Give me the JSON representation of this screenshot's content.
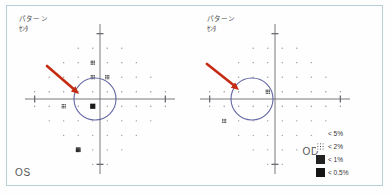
{
  "report": {
    "frame_border_color": "#b9cdd6",
    "background_color": "#fefefe"
  },
  "panels": [
    {
      "id": "os",
      "eye_label": "OS",
      "header_line1": "パターン",
      "header_line2": "ｾﾝﾀ",
      "annotation": {
        "arrow_color": "#c52a12",
        "circle_color": "#5a5f9e",
        "arrow_from": [
          40,
          60
        ],
        "arrow_to": [
          72,
          88
        ],
        "circle_center": [
          88,
          93
        ],
        "circle_radius": 21
      }
    },
    {
      "id": "od",
      "eye_label": "OD",
      "header_line1": "パターン",
      "header_line2": "ｾﾝﾀ",
      "annotation": {
        "arrow_color": "#c52a12",
        "circle_color": "#5a5f9e",
        "arrow_from": [
          12,
          58
        ],
        "arrow_to": [
          44,
          84
        ],
        "circle_center": [
          57,
          93
        ],
        "circle_radius": 21
      }
    }
  ],
  "legend": {
    "title": "probability-symbols",
    "rows": [
      {
        "symbol": "stipple-sparse",
        "label": "< 5%"
      },
      {
        "symbol": "stipple-medium",
        "label": "< 2%"
      },
      {
        "symbol": "stipple-dense",
        "label": "< 1%"
      },
      {
        "symbol": "solid-black",
        "label": "< 0.5%"
      }
    ]
  },
  "chart_data": {
    "type": "scatter",
    "xlabel": "",
    "ylabel": "",
    "xlim": [
      -30,
      30
    ],
    "ylim": [
      -30,
      30
    ],
    "grid": false,
    "note": "Humphrey 24-2 test-point grid. severity 0 = normal dot, 1 = <5%, 2 = <2%, 3 = <1%, 4 = <0.5%",
    "series": [
      {
        "name": "OS",
        "points": [
          {
            "x": -9,
            "y": 21,
            "severity": 0
          },
          {
            "x": -3,
            "y": 21,
            "severity": 0
          },
          {
            "x": 3,
            "y": 21,
            "severity": 0
          },
          {
            "x": 9,
            "y": 21,
            "severity": 0
          },
          {
            "x": -15,
            "y": 15,
            "severity": 0
          },
          {
            "x": -9,
            "y": 15,
            "severity": 0
          },
          {
            "x": -3,
            "y": 15,
            "severity": 2
          },
          {
            "x": 3,
            "y": 15,
            "severity": 0
          },
          {
            "x": 9,
            "y": 15,
            "severity": 0
          },
          {
            "x": 15,
            "y": 15,
            "severity": 0
          },
          {
            "x": -21,
            "y": 9,
            "severity": 0
          },
          {
            "x": -15,
            "y": 9,
            "severity": 0
          },
          {
            "x": -9,
            "y": 9,
            "severity": 0
          },
          {
            "x": -3,
            "y": 9,
            "severity": 2
          },
          {
            "x": 3,
            "y": 9,
            "severity": 2
          },
          {
            "x": 9,
            "y": 9,
            "severity": 0
          },
          {
            "x": 15,
            "y": 9,
            "severity": 0
          },
          {
            "x": 21,
            "y": 9,
            "severity": 0
          },
          {
            "x": -27,
            "y": 3,
            "severity": 0
          },
          {
            "x": -21,
            "y": 3,
            "severity": 0
          },
          {
            "x": -15,
            "y": 3,
            "severity": 0
          },
          {
            "x": -9,
            "y": 3,
            "severity": 0
          },
          {
            "x": -3,
            "y": 3,
            "severity": 0
          },
          {
            "x": 3,
            "y": 3,
            "severity": 0
          },
          {
            "x": 9,
            "y": 3,
            "severity": 0
          },
          {
            "x": 15,
            "y": 3,
            "severity": 0
          },
          {
            "x": 21,
            "y": 3,
            "severity": 0
          },
          {
            "x": 27,
            "y": 3,
            "severity": 0
          },
          {
            "x": -27,
            "y": -3,
            "severity": 0
          },
          {
            "x": -21,
            "y": -3,
            "severity": 0
          },
          {
            "x": -15,
            "y": -3,
            "severity": 2
          },
          {
            "x": -9,
            "y": -3,
            "severity": 0
          },
          {
            "x": -3,
            "y": -3,
            "severity": 4
          },
          {
            "x": 3,
            "y": -3,
            "severity": 0
          },
          {
            "x": 9,
            "y": -3,
            "severity": 0
          },
          {
            "x": 15,
            "y": -3,
            "severity": 0
          },
          {
            "x": 21,
            "y": -3,
            "severity": 0
          },
          {
            "x": 27,
            "y": -3,
            "severity": 0
          },
          {
            "x": -21,
            "y": -9,
            "severity": 0
          },
          {
            "x": -15,
            "y": -9,
            "severity": 0
          },
          {
            "x": -9,
            "y": -9,
            "severity": 0
          },
          {
            "x": -3,
            "y": -9,
            "severity": 0
          },
          {
            "x": 3,
            "y": -9,
            "severity": 0
          },
          {
            "x": 9,
            "y": -9,
            "severity": 0
          },
          {
            "x": 15,
            "y": -9,
            "severity": 0
          },
          {
            "x": 21,
            "y": -9,
            "severity": 0
          },
          {
            "x": -15,
            "y": -15,
            "severity": 0
          },
          {
            "x": -9,
            "y": -15,
            "severity": 0
          },
          {
            "x": -3,
            "y": -15,
            "severity": 0
          },
          {
            "x": 3,
            "y": -15,
            "severity": 0
          },
          {
            "x": 9,
            "y": -15,
            "severity": 0
          },
          {
            "x": 15,
            "y": -15,
            "severity": 0
          },
          {
            "x": -9,
            "y": -21,
            "severity": 3
          },
          {
            "x": -3,
            "y": -21,
            "severity": 0
          },
          {
            "x": 3,
            "y": -21,
            "severity": 0
          },
          {
            "x": 9,
            "y": -21,
            "severity": 0
          },
          {
            "x": -3,
            "y": -27,
            "severity": 0
          },
          {
            "x": 3,
            "y": -27,
            "severity": 0
          }
        ]
      },
      {
        "name": "OD",
        "points": [
          {
            "x": -9,
            "y": 21,
            "severity": 0
          },
          {
            "x": -3,
            "y": 21,
            "severity": 0
          },
          {
            "x": 3,
            "y": 21,
            "severity": 0
          },
          {
            "x": 9,
            "y": 21,
            "severity": 0
          },
          {
            "x": -15,
            "y": 15,
            "severity": 0
          },
          {
            "x": -9,
            "y": 15,
            "severity": 0
          },
          {
            "x": -3,
            "y": 15,
            "severity": 0
          },
          {
            "x": 3,
            "y": 15,
            "severity": 0
          },
          {
            "x": 9,
            "y": 15,
            "severity": 0
          },
          {
            "x": 15,
            "y": 15,
            "severity": 0
          },
          {
            "x": -21,
            "y": 9,
            "severity": 0
          },
          {
            "x": -15,
            "y": 9,
            "severity": 0
          },
          {
            "x": -9,
            "y": 9,
            "severity": 0
          },
          {
            "x": -3,
            "y": 9,
            "severity": 0
          },
          {
            "x": 3,
            "y": 9,
            "severity": 0
          },
          {
            "x": 9,
            "y": 9,
            "severity": 0
          },
          {
            "x": 15,
            "y": 9,
            "severity": 0
          },
          {
            "x": 21,
            "y": 9,
            "severity": 0
          },
          {
            "x": -27,
            "y": 3,
            "severity": 0
          },
          {
            "x": -21,
            "y": 3,
            "severity": 0
          },
          {
            "x": -15,
            "y": 3,
            "severity": 0
          },
          {
            "x": -9,
            "y": 3,
            "severity": 0
          },
          {
            "x": -3,
            "y": 3,
            "severity": 2
          },
          {
            "x": 3,
            "y": 3,
            "severity": 0
          },
          {
            "x": 9,
            "y": 3,
            "severity": 0
          },
          {
            "x": 15,
            "y": 3,
            "severity": 0
          },
          {
            "x": 21,
            "y": 3,
            "severity": 0
          },
          {
            "x": 27,
            "y": 3,
            "severity": 0
          },
          {
            "x": -27,
            "y": -3,
            "severity": 0
          },
          {
            "x": -21,
            "y": -3,
            "severity": 0
          },
          {
            "x": -15,
            "y": -3,
            "severity": 0
          },
          {
            "x": -9,
            "y": -3,
            "severity": 0
          },
          {
            "x": -3,
            "y": -3,
            "severity": 0
          },
          {
            "x": 3,
            "y": -3,
            "severity": 0
          },
          {
            "x": 9,
            "y": -3,
            "severity": 0
          },
          {
            "x": 15,
            "y": -3,
            "severity": 0
          },
          {
            "x": 21,
            "y": -3,
            "severity": 0
          },
          {
            "x": 27,
            "y": -3,
            "severity": 0
          },
          {
            "x": -21,
            "y": -9,
            "severity": 2
          },
          {
            "x": -15,
            "y": -9,
            "severity": 0
          },
          {
            "x": -9,
            "y": -9,
            "severity": 0
          },
          {
            "x": -3,
            "y": -9,
            "severity": 0
          },
          {
            "x": 3,
            "y": -9,
            "severity": 0
          },
          {
            "x": 9,
            "y": -9,
            "severity": 0
          },
          {
            "x": 15,
            "y": -9,
            "severity": 0
          },
          {
            "x": 21,
            "y": -9,
            "severity": 0
          },
          {
            "x": -15,
            "y": -15,
            "severity": 0
          },
          {
            "x": -9,
            "y": -15,
            "severity": 0
          },
          {
            "x": -3,
            "y": -15,
            "severity": 0
          },
          {
            "x": 3,
            "y": -15,
            "severity": 0
          },
          {
            "x": 9,
            "y": -15,
            "severity": 0
          },
          {
            "x": 15,
            "y": -15,
            "severity": 0
          },
          {
            "x": -9,
            "y": -21,
            "severity": 0
          },
          {
            "x": -3,
            "y": -21,
            "severity": 0
          },
          {
            "x": 3,
            "y": -21,
            "severity": 0
          },
          {
            "x": 9,
            "y": -21,
            "severity": 0
          },
          {
            "x": -3,
            "y": -27,
            "severity": 0
          },
          {
            "x": 3,
            "y": -27,
            "severity": 0
          }
        ]
      }
    ]
  }
}
